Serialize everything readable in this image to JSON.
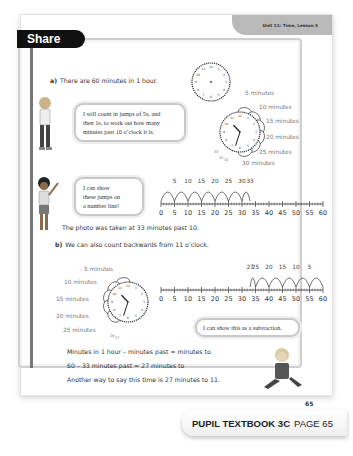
{
  "header": {
    "unit_label": "Unit 11: Time, Lesson 5",
    "section_title": "Share"
  },
  "part_a": {
    "label": "a)",
    "intro": "There are 60 minutes in 1 hour.",
    "bubble_1": [
      "I will count in jumps of 5s, and",
      "then 1s, to work out how many",
      "minutes past 10 o’clock it is."
    ],
    "bubble_2": [
      "I can show",
      "these jumps on",
      "a number line!"
    ],
    "clock_labels": [
      "5 minutes",
      "10 minutes",
      "15 minutes",
      "20 minutes",
      "25 minutes",
      "30 minutes"
    ],
    "clock_small_labels": [
      "33",
      "32",
      "31"
    ],
    "jump_labels": [
      "5",
      "10",
      "15",
      "20",
      "25",
      "30",
      "33"
    ],
    "number_line_ticks": [
      "0",
      "5",
      "10",
      "15",
      "20",
      "25",
      "30",
      "35",
      "40",
      "45",
      "50",
      "55",
      "60"
    ],
    "conclusion": "The photo was taken at 33 minutes past 10."
  },
  "part_b": {
    "label": "b)",
    "intro": "We can also count backwards from 11 o’clock.",
    "clock_labels": [
      "5 minutes",
      "10 minutes",
      "15 minutes",
      "20 minutes",
      "25 minutes"
    ],
    "clock_small_labels": [
      "26",
      "27"
    ],
    "jump_labels": [
      "27",
      "25",
      "20",
      "15",
      "10",
      "5"
    ],
    "number_line_ticks": [
      "0",
      "5",
      "10",
      "15",
      "20",
      "25",
      "30",
      "35",
      "40",
      "45",
      "50",
      "55",
      "60"
    ],
    "bubble": "I can show this as a subtraction.",
    "lines": [
      "Minutes in 1 hour – minutes past = minutes to",
      "60 – 33 minutes past = 27 minutes to",
      "Another way to say this time is 27 minutes to 11."
    ]
  },
  "page_number": "65",
  "footer": {
    "book": "PUPIL TEXTBOOK 3C",
    "page": "PAGE 65"
  },
  "clock_a_time": {
    "hour": 10,
    "minute": 33
  },
  "clock_b_time": {
    "hour": 10,
    "minute": 33
  }
}
